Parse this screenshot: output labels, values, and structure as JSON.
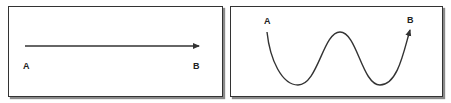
{
  "panels": [
    {
      "name": "straight-path",
      "start_label": "A",
      "end_label": "B",
      "path_type": "straight-arrow"
    },
    {
      "name": "wavy-path",
      "start_label": "A",
      "end_label": "B",
      "path_type": "curved-arrow"
    }
  ],
  "colors": {
    "line": "#333333",
    "border": "#333333",
    "shadow": "#8a8a8a",
    "background": "#ffffff"
  }
}
